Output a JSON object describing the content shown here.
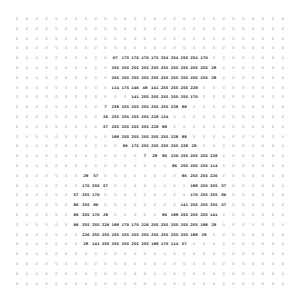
{
  "chart_data": {
    "type": "heatmap",
    "title": "",
    "rows": 28,
    "cols": 28,
    "values": [
      [
        0,
        0,
        0,
        0,
        0,
        0,
        0,
        0,
        0,
        0,
        0,
        0,
        0,
        0,
        0,
        0,
        0,
        0,
        0,
        0,
        0,
        0,
        0,
        0,
        0,
        0,
        0,
        0
      ],
      [
        0,
        0,
        0,
        0,
        0,
        0,
        0,
        0,
        0,
        0,
        0,
        0,
        0,
        0,
        0,
        0,
        0,
        0,
        0,
        0,
        0,
        0,
        0,
        0,
        0,
        0,
        0,
        0
      ],
      [
        0,
        0,
        0,
        0,
        0,
        0,
        0,
        0,
        0,
        0,
        0,
        0,
        0,
        0,
        0,
        0,
        0,
        0,
        0,
        0,
        0,
        0,
        0,
        0,
        0,
        0,
        0,
        0
      ],
      [
        0,
        0,
        0,
        0,
        0,
        0,
        0,
        0,
        0,
        0,
        0,
        0,
        0,
        0,
        0,
        0,
        0,
        0,
        0,
        0,
        0,
        0,
        0,
        0,
        0,
        0,
        0,
        0
      ],
      [
        0,
        0,
        0,
        0,
        0,
        0,
        0,
        0,
        0,
        0,
        67,
        175,
        170,
        170,
        175,
        254,
        254,
        255,
        254,
        170,
        0,
        0,
        0,
        0,
        0,
        0,
        0,
        0
      ],
      [
        0,
        0,
        0,
        0,
        0,
        0,
        0,
        0,
        0,
        0,
        255,
        255,
        255,
        255,
        255,
        255,
        255,
        255,
        255,
        255,
        29,
        0,
        0,
        0,
        0,
        0,
        0,
        0
      ],
      [
        0,
        0,
        0,
        0,
        0,
        0,
        0,
        0,
        0,
        0,
        255,
        255,
        255,
        255,
        255,
        255,
        255,
        255,
        255,
        255,
        29,
        0,
        0,
        0,
        0,
        0,
        0,
        0
      ],
      [
        0,
        0,
        0,
        0,
        0,
        0,
        0,
        0,
        0,
        0,
        114,
        175,
        146,
        48,
        141,
        255,
        255,
        255,
        228,
        0,
        0,
        0,
        0,
        0,
        0,
        0,
        0,
        0
      ],
      [
        0,
        0,
        0,
        0,
        0,
        0,
        0,
        0,
        0,
        0,
        0,
        0,
        141,
        255,
        255,
        255,
        255,
        255,
        170,
        0,
        0,
        0,
        0,
        0,
        0,
        0,
        0,
        0
      ],
      [
        0,
        0,
        0,
        0,
        0,
        0,
        0,
        0,
        0,
        7,
        238,
        255,
        255,
        255,
        255,
        255,
        228,
        98,
        0,
        0,
        0,
        0,
        0,
        0,
        0,
        0,
        0,
        0
      ],
      [
        0,
        0,
        0,
        0,
        0,
        0,
        0,
        0,
        0,
        26,
        255,
        255,
        255,
        255,
        228,
        124,
        0,
        0,
        0,
        0,
        0,
        0,
        0,
        0,
        0,
        0,
        0,
        0
      ],
      [
        0,
        0,
        0,
        0,
        0,
        0,
        0,
        0,
        0,
        57,
        255,
        255,
        255,
        255,
        228,
        98,
        0,
        0,
        0,
        0,
        0,
        0,
        0,
        0,
        0,
        0,
        0,
        0
      ],
      [
        0,
        0,
        0,
        0,
        0,
        0,
        0,
        0,
        0,
        0,
        198,
        255,
        255,
        255,
        255,
        255,
        228,
        98,
        0,
        0,
        0,
        0,
        0,
        0,
        0,
        0,
        0,
        0
      ],
      [
        0,
        0,
        0,
        0,
        0,
        0,
        0,
        0,
        0,
        0,
        0,
        86,
        175,
        255,
        255,
        255,
        255,
        228,
        29,
        0,
        0,
        0,
        0,
        0,
        0,
        0,
        0,
        0
      ],
      [
        0,
        0,
        0,
        0,
        0,
        0,
        0,
        0,
        0,
        0,
        0,
        0,
        0,
        7,
        29,
        86,
        226,
        255,
        255,
        255,
        228,
        0,
        0,
        0,
        0,
        0,
        0,
        0
      ],
      [
        0,
        0,
        0,
        0,
        0,
        0,
        0,
        0,
        0,
        0,
        0,
        0,
        0,
        0,
        0,
        0,
        86,
        255,
        255,
        255,
        114,
        0,
        0,
        0,
        0,
        0,
        0,
        0
      ],
      [
        0,
        0,
        0,
        0,
        0,
        0,
        0,
        29,
        57,
        0,
        0,
        0,
        0,
        0,
        0,
        0,
        0,
        86,
        255,
        255,
        226,
        0,
        0,
        0,
        0,
        0,
        0,
        0
      ],
      [
        0,
        0,
        0,
        0,
        0,
        0,
        0,
        170,
        255,
        57,
        0,
        0,
        0,
        0,
        0,
        0,
        0,
        0,
        198,
        255,
        255,
        57,
        0,
        0,
        0,
        0,
        0,
        0
      ],
      [
        0,
        0,
        0,
        0,
        0,
        0,
        57,
        255,
        170,
        0,
        0,
        0,
        0,
        0,
        0,
        0,
        0,
        0,
        170,
        255,
        255,
        86,
        0,
        0,
        0,
        0,
        0,
        0
      ],
      [
        0,
        0,
        0,
        0,
        0,
        0,
        86,
        255,
        86,
        0,
        0,
        0,
        0,
        0,
        0,
        0,
        0,
        141,
        255,
        255,
        255,
        57,
        0,
        0,
        0,
        0,
        0,
        0
      ],
      [
        0,
        0,
        0,
        0,
        0,
        0,
        86,
        255,
        170,
        29,
        0,
        0,
        0,
        0,
        0,
        86,
        198,
        255,
        255,
        255,
        141,
        0,
        0,
        0,
        0,
        0,
        0,
        0
      ],
      [
        0,
        0,
        0,
        0,
        0,
        0,
        86,
        255,
        255,
        226,
        198,
        170,
        170,
        226,
        255,
        255,
        255,
        255,
        255,
        198,
        29,
        0,
        0,
        0,
        0,
        0,
        0,
        0
      ],
      [
        0,
        0,
        0,
        0,
        0,
        0,
        0,
        226,
        255,
        255,
        255,
        255,
        255,
        255,
        255,
        255,
        255,
        255,
        198,
        29,
        0,
        0,
        0,
        0,
        0,
        0,
        0,
        0
      ],
      [
        0,
        0,
        0,
        0,
        0,
        0,
        0,
        29,
        141,
        255,
        255,
        255,
        255,
        255,
        198,
        170,
        114,
        57,
        0,
        0,
        0,
        0,
        0,
        0,
        0,
        0,
        0,
        0
      ],
      [
        0,
        0,
        0,
        0,
        0,
        0,
        0,
        0,
        0,
        0,
        0,
        0,
        0,
        0,
        0,
        0,
        0,
        0,
        0,
        0,
        0,
        0,
        0,
        0,
        0,
        0,
        0,
        0
      ],
      [
        0,
        0,
        0,
        0,
        0,
        0,
        0,
        0,
        0,
        0,
        0,
        0,
        0,
        0,
        0,
        0,
        0,
        0,
        0,
        0,
        0,
        0,
        0,
        0,
        0,
        0,
        0,
        0
      ],
      [
        0,
        0,
        0,
        0,
        0,
        0,
        0,
        0,
        0,
        0,
        0,
        0,
        0,
        0,
        0,
        0,
        0,
        0,
        0,
        0,
        0,
        0,
        0,
        0,
        0,
        0,
        0,
        0
      ],
      [
        0,
        0,
        0,
        0,
        0,
        0,
        0,
        0,
        0,
        0,
        0,
        0,
        0,
        0,
        0,
        0,
        0,
        0,
        0,
        0,
        0,
        0,
        0,
        0,
        0,
        0,
        0,
        0
      ]
    ],
    "grid": false,
    "legend": null
  }
}
